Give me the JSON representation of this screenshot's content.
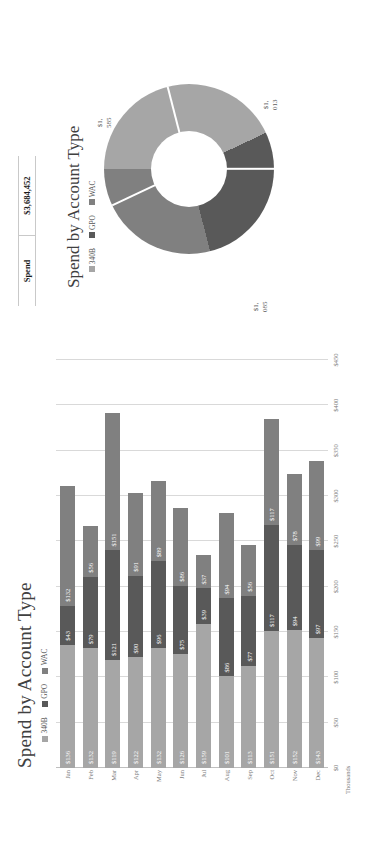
{
  "colors": {
    "series_340b": "#a6a6a6",
    "series_gpo": "#595959",
    "series_wac": "#808080",
    "grid": "#d9d9d9",
    "text": "#7a7a7a"
  },
  "spend_table": {
    "header_label": "Spend",
    "value": "$3,684,452"
  },
  "bar_chart": {
    "title": "Spend by Account Type",
    "axis_title": "Thousands",
    "legend": [
      "340B",
      "GPO",
      "WAC"
    ]
  },
  "donut_chart": {
    "title": "Spend by Account Type",
    "legend": [
      "340B",
      "GPO",
      "WAC"
    ],
    "labels": [
      "$1,585,763 ,\n43%",
      "$1,013,629 ,\n28%",
      "$1,085,060 ,\n29%"
    ],
    "label_340b": "$1,585,763 , 43%",
    "label_gpo": "$1,013,629 , 28%",
    "label_wac": "$1,085,060 , 29%"
  },
  "chart_data": [
    {
      "type": "bar",
      "title": "Spend by Account Type",
      "subtype": "stacked-horizontal",
      "xlabel": "Thousands",
      "ylabel": "",
      "categories": [
        "Jan",
        "Feb",
        "Mar",
        "Apr",
        "May",
        "Jun",
        "Jul",
        "Aug",
        "Sep",
        "Oct",
        "Nov",
        "Dec"
      ],
      "series": [
        {
          "name": "340B",
          "values": [
            136,
            132,
            119,
            122,
            132,
            126,
            159,
            101,
            113,
            151,
            152,
            143
          ]
        },
        {
          "name": "GPO",
          "values": [
            43,
            79,
            121,
            90,
            96,
            75,
            39,
            86,
            77,
            117,
            94,
            97
          ]
        },
        {
          "name": "WAC",
          "values": [
            132,
            56,
            151,
            91,
            89,
            86,
            37,
            94,
            56,
            117,
            78,
            99
          ]
        }
      ],
      "value_labels": {
        "Jan": [
          "$136",
          "$43",
          "$132"
        ],
        "Feb": [
          "$132",
          "$79",
          "$56"
        ],
        "Mar": [
          "$119",
          "$121",
          "$151"
        ],
        "Apr": [
          "$122",
          "$90",
          "$91"
        ],
        "May": [
          "$132",
          "$96",
          "$89"
        ],
        "Jun": [
          "$126",
          "$75",
          "$86"
        ],
        "Jul": [
          "$159",
          "$39",
          "$37"
        ],
        "Aug": [
          "$101",
          "$86",
          "$94"
        ],
        "Sep": [
          "$113",
          "$77",
          "$56"
        ],
        "Oct": [
          "$151",
          "$117",
          "$117"
        ],
        "Nov": [
          "$152",
          "$94",
          "$78"
        ],
        "Dec": [
          "$143",
          "$97",
          "$99"
        ]
      },
      "axis_ticks": [
        "$0",
        "$50",
        "$100",
        "$150",
        "$200",
        "$250",
        "$300",
        "$350",
        "$400",
        "$450"
      ],
      "xlim": [
        0,
        450
      ],
      "grid": true,
      "legend_position": "top"
    },
    {
      "type": "pie",
      "subtype": "donut",
      "title": "Spend by Account Type",
      "categories": [
        "340B",
        "GPO",
        "WAC"
      ],
      "values": [
        1585763,
        1013629,
        1085060
      ],
      "percentages": [
        43,
        28,
        29
      ],
      "value_labels": [
        "$1,585,763 , 43%",
        "$1,013,629 , 28%",
        "$1,085,060 , 29%"
      ],
      "total": "$3,684,452",
      "legend_position": "top"
    }
  ]
}
